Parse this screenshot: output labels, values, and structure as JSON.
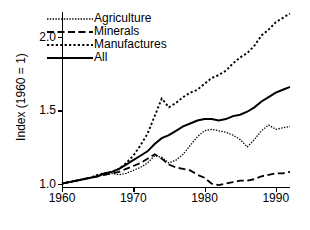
{
  "chart_data": {
    "type": "line",
    "title": "",
    "xlabel": "",
    "ylabel": "Index (1960 = 1)",
    "xlim": [
      1960,
      1992
    ],
    "ylim": [
      0.97,
      2.17
    ],
    "xticks": [
      1960,
      1970,
      1980,
      1990
    ],
    "xtick_labels": [
      "1960",
      "1970",
      "1980",
      "1990"
    ],
    "yticks": [
      1.0,
      1.5,
      2.0
    ],
    "ytick_labels": [
      "1.0",
      "1.5",
      "2.0"
    ],
    "grid": false,
    "legend_position": "top-left",
    "x": [
      1960,
      1961,
      1962,
      1963,
      1964,
      1965,
      1966,
      1967,
      1968,
      1969,
      1970,
      1971,
      1972,
      1973,
      1974,
      1975,
      1976,
      1977,
      1978,
      1979,
      1980,
      1981,
      1982,
      1983,
      1984,
      1985,
      1986,
      1987,
      1988,
      1989,
      1990,
      1991,
      1992
    ],
    "series": [
      {
        "name": "Agriculture",
        "style": "fine-dotted",
        "color": "#000000",
        "values": [
          1.0,
          1.01,
          1.02,
          1.03,
          1.04,
          1.05,
          1.06,
          1.07,
          1.06,
          1.07,
          1.09,
          1.11,
          1.14,
          1.19,
          1.18,
          1.14,
          1.16,
          1.2,
          1.26,
          1.32,
          1.36,
          1.37,
          1.36,
          1.35,
          1.33,
          1.3,
          1.25,
          1.3,
          1.36,
          1.4,
          1.37,
          1.38,
          1.39
        ]
      },
      {
        "name": "Minerals",
        "style": "dashed",
        "color": "#000000",
        "values": [
          1.0,
          1.01,
          1.02,
          1.03,
          1.04,
          1.05,
          1.06,
          1.07,
          1.08,
          1.1,
          1.12,
          1.14,
          1.17,
          1.2,
          1.17,
          1.13,
          1.11,
          1.1,
          1.09,
          1.06,
          1.04,
          1.0,
          0.99,
          1.0,
          1.01,
          1.02,
          1.02,
          1.03,
          1.05,
          1.06,
          1.07,
          1.07,
          1.08
        ]
      },
      {
        "name": "Manufactures",
        "style": "coarse-dotted",
        "color": "#000000",
        "values": [
          1.0,
          1.01,
          1.02,
          1.03,
          1.04,
          1.06,
          1.07,
          1.08,
          1.1,
          1.14,
          1.19,
          1.26,
          1.34,
          1.46,
          1.58,
          1.52,
          1.55,
          1.59,
          1.62,
          1.64,
          1.68,
          1.72,
          1.74,
          1.77,
          1.82,
          1.86,
          1.89,
          1.94,
          2.01,
          2.05,
          2.1,
          2.13,
          2.16
        ]
      },
      {
        "name": "All",
        "style": "solid",
        "color": "#000000",
        "values": [
          1.0,
          1.01,
          1.02,
          1.03,
          1.04,
          1.05,
          1.07,
          1.08,
          1.1,
          1.13,
          1.16,
          1.19,
          1.22,
          1.27,
          1.31,
          1.33,
          1.36,
          1.39,
          1.41,
          1.43,
          1.44,
          1.44,
          1.43,
          1.44,
          1.46,
          1.47,
          1.49,
          1.52,
          1.56,
          1.59,
          1.62,
          1.64,
          1.66
        ]
      }
    ]
  },
  "legend": {
    "items": [
      {
        "label": "Agriculture"
      },
      {
        "label": "Minerals"
      },
      {
        "label": "Manufactures"
      },
      {
        "label": "All"
      }
    ]
  }
}
